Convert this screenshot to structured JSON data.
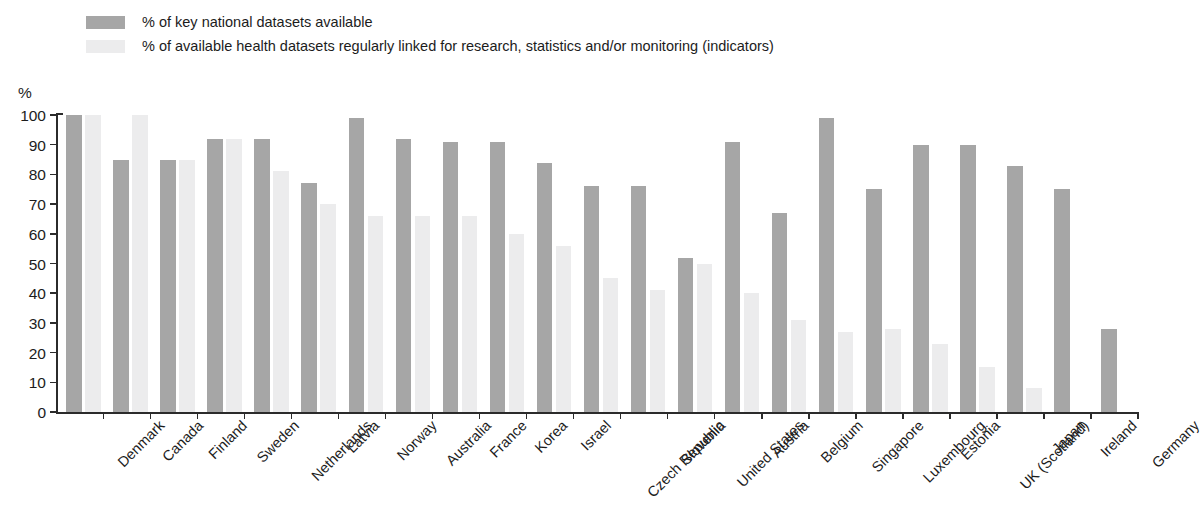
{
  "legend": {
    "items": [
      {
        "label": "% of key national datasets available",
        "swatch": "#a6a6a6",
        "name": "legend-swatch-key-datasets"
      },
      {
        "label": "% of available health datasets regularly linked for research, statistics and/or monitoring (indicators)",
        "swatch": "#ececed",
        "name": "legend-swatch-linked-datasets"
      }
    ]
  },
  "axis": {
    "y_unit": "%",
    "ticks": [
      "100",
      "90",
      "80",
      "70",
      "60",
      "50",
      "40",
      "30",
      "20",
      "10",
      "0"
    ]
  },
  "colors": {
    "series_key_datasets": "#a6a6a6",
    "series_linked_datasets": "#ececed",
    "axis": "#2b2b2b",
    "text": "#1c1c1c",
    "background": "#ffffff"
  },
  "chart_data": {
    "type": "bar",
    "title": "",
    "subtitle": "",
    "xlabel": "",
    "ylabel": "%",
    "ylim": [
      0,
      100
    ],
    "ytick_interval": 10,
    "grid": false,
    "legend_position": "top-left",
    "orientation": "vertical",
    "categories": [
      "Denmark",
      "Canada",
      "Finland",
      "Sweden",
      "Netherlands",
      "Latvia",
      "Norway",
      "Australia",
      "France",
      "Korea",
      "Israel",
      "Czech Republic",
      "Slovenia",
      "United States",
      "Austria",
      "Belgium",
      "Singapore",
      "Luxembourg",
      "Estonia",
      "UK (Scotland)",
      "Japan",
      "Ireland",
      "Germany"
    ],
    "series": [
      {
        "name": "% of key national datasets available",
        "color": "#a6a6a6",
        "values": [
          100,
          85,
          85,
          92,
          92,
          77,
          99,
          92,
          91,
          91,
          84,
          76,
          76,
          52,
          91,
          67,
          99,
          75,
          90,
          90,
          83,
          75,
          28
        ]
      },
      {
        "name": "% of available health datasets regularly linked for research, statistics and/or monitoring (indicators)",
        "color": "#ececed",
        "values": [
          100,
          100,
          85,
          92,
          81,
          70,
          66,
          66,
          66,
          60,
          56,
          45,
          41,
          50,
          40,
          31,
          27,
          28,
          23,
          15,
          8,
          0,
          0
        ]
      }
    ]
  }
}
